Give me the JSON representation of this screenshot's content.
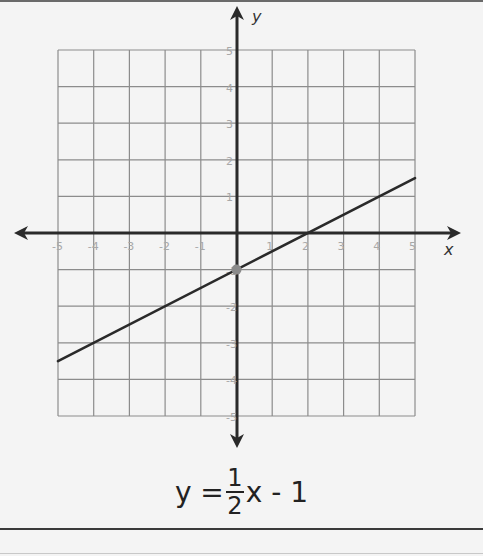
{
  "chart_data": {
    "type": "line",
    "title": "",
    "xlabel": "x",
    "ylabel": "y",
    "xlim": [
      -5,
      5
    ],
    "ylim": [
      -5,
      5
    ],
    "grid": true,
    "x_ticks": [
      -5,
      -4,
      -3,
      -2,
      -1,
      1,
      2,
      3,
      4,
      5
    ],
    "y_ticks": [
      5,
      4,
      3,
      2,
      1,
      -1,
      -2,
      -3,
      -4,
      -5
    ],
    "series": [
      {
        "name": "y = 1/2x - 1",
        "x": [
          -5,
          5
        ],
        "y": [
          -3.5,
          1.5
        ],
        "slope": 0.5,
        "intercept": -1
      }
    ],
    "highlighted_points": [
      {
        "x": 0,
        "y": -1,
        "label": "y-intercept"
      }
    ],
    "annotations": [
      "y = 1/2 x - 1"
    ]
  },
  "equation": {
    "lhs": "y =",
    "numerator": "1",
    "denominator": "2",
    "rhs": "x - 1"
  },
  "axes": {
    "x_label": "x",
    "y_label": "y",
    "x_tick_labels": [
      "-5",
      "-4",
      "-3",
      "-2",
      "-1",
      "1",
      "2",
      "3",
      "4",
      "5"
    ],
    "y_tick_labels": [
      "5",
      "4",
      "3",
      "2",
      "1",
      "-1",
      "-2",
      "-3",
      "-4",
      "-5"
    ]
  },
  "colors": {
    "line": "#2a2a2a",
    "grid": "#8c8c8c",
    "axis": "#2a2a2a",
    "point": "#8a8a8a",
    "background": "#f4f4f4"
  }
}
